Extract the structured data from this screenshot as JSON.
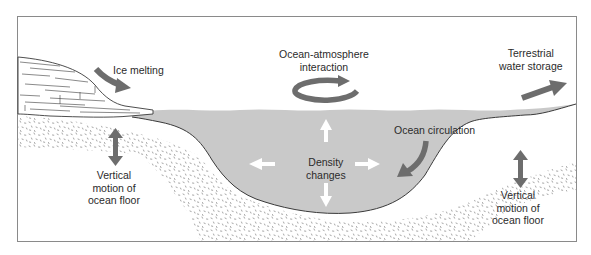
{
  "diagram": {
    "colors": {
      "frame": "#8a8a8a",
      "water": "#c9c9c9",
      "sediment_dots": "#8c8c8c",
      "arrow_dark": "#6d6d6d",
      "arrow_white": "#ffffff",
      "text": "#2b2b2b",
      "outline": "#3a3a3a"
    },
    "labels": {
      "ice_melting": "Ice melting",
      "ocean_atmosphere": [
        "Ocean-atmosphere",
        "interaction"
      ],
      "terrestrial": [
        "Terrestrial",
        "water storage"
      ],
      "ocean_circulation": "Ocean circulation",
      "density": [
        "Density",
        "changes"
      ],
      "vertical_left": [
        "Vertical",
        "motion of",
        "ocean floor"
      ],
      "vertical_right": [
        "Vertical",
        "motion of",
        "ocean floor"
      ]
    },
    "icons": {
      "ice_melting_arrow": "curved-down-right-arrow",
      "ocean_atmosphere_arrow": "circular-clockwise-arrow",
      "terrestrial_arrow": "up-right-arrow",
      "ocean_circulation_arrow": "curved-down-left-arrow",
      "density_arrows": "four-way-arrows",
      "vertical_motion_arrows": "double-headed-vertical-arrow"
    }
  }
}
